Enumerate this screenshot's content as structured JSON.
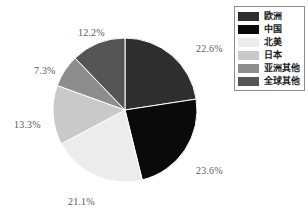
{
  "chart_data": {
    "type": "pie",
    "title": "",
    "subtitle": "",
    "xlabel": "",
    "ylabel": "",
    "grid": false,
    "legend_position": "top-right",
    "start_angle_deg": 0,
    "direction": "clockwise",
    "categories": [
      "欧洲",
      "中国",
      "北美",
      "日本",
      "亚洲其他",
      "全球其他"
    ],
    "values": [
      22.6,
      23.6,
      21.1,
      13.3,
      7.3,
      12.2
    ],
    "value_labels": [
      "22.6%",
      "23.6%",
      "21.1%",
      "13.3%",
      "7.3%",
      "12.2%"
    ],
    "colors": [
      "#2e2e2e",
      "#0a0a0a",
      "#ececec",
      "#c9c9c9",
      "#8d8d8d",
      "#555555"
    ],
    "slices": [
      {
        "name": "欧洲",
        "value": 22.6,
        "label": "22.6%",
        "color": "#2e2e2e",
        "label_x": 196,
        "label_y": 44
      },
      {
        "name": "中国",
        "value": 23.6,
        "label": "23.6%",
        "color": "#0a0a0a",
        "label_x": 196,
        "label_y": 166
      },
      {
        "name": "北美",
        "value": 21.1,
        "label": "21.1%",
        "color": "#ececec",
        "label_x": 68,
        "label_y": 197
      },
      {
        "name": "日本",
        "value": 13.3,
        "label": "13.3%",
        "color": "#c9c9c9",
        "label_x": 14,
        "label_y": 120
      },
      {
        "name": "亚洲其他",
        "value": 7.3,
        "label": "7.3%",
        "color": "#8d8d8d",
        "label_x": 34,
        "label_y": 66
      },
      {
        "name": "全球其他",
        "value": 12.2,
        "label": "12.2%",
        "color": "#555555",
        "label_x": 78,
        "label_y": 28
      }
    ]
  },
  "legend": {
    "items": [
      {
        "label": "欧洲",
        "color": "#2e2e2e"
      },
      {
        "label": "中国",
        "color": "#0a0a0a"
      },
      {
        "label": "北美",
        "color": "#ececec"
      },
      {
        "label": "日本",
        "color": "#c9c9c9"
      },
      {
        "label": "亚洲其他",
        "color": "#8d8d8d"
      },
      {
        "label": "全球其他",
        "color": "#555555"
      }
    ]
  },
  "style": {
    "background": "#ffffff",
    "slice_border": "#ffffff",
    "label_color": "#5a5a5a",
    "legend_border": "#8d8d8d"
  },
  "geometry": {
    "center_x": 125,
    "center_y": 110,
    "radius": 72
  }
}
